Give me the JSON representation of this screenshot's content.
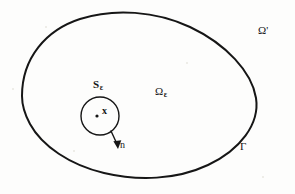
{
  "figure": {
    "kind": "math-diagram",
    "background_color": "#fdfdfc",
    "ink_color": "#161616",
    "width": 295,
    "height": 194,
    "labels": {
      "exterior_domain": "Ω",
      "exterior_domain_prime": "'",
      "interior_domain": "Ω",
      "interior_domain_subscript": "ε",
      "small_sphere": "S",
      "small_sphere_subscript": "ε",
      "point": "x",
      "normal": "n",
      "boundary": "Γ"
    },
    "geometry": {
      "outer_curve": {
        "name": "boundary-gamma-curve",
        "type": "closed-blob",
        "path": "M 22,96 C 22,55 60,17 122,14 C 178,11 232,37 252,72 C 268,101 258,140 222,162 C 186,184 130,182 92,167 C 50,150 22,128 22,96 Z",
        "stroke_width": 2.0
      },
      "inner_circle": {
        "name": "small-sphere-circle",
        "cx": 100,
        "cy": 116,
        "r": 19,
        "stroke_width": 1.4
      },
      "center_dot": {
        "name": "center-point-dot",
        "cx": 97,
        "cy": 116,
        "r": 1.6
      },
      "normal_arrow": {
        "name": "outward-normal-arrow",
        "x1": 111,
        "y1": 131,
        "x2": 118,
        "y2": 147,
        "stroke_width": 1.3
      }
    }
  }
}
